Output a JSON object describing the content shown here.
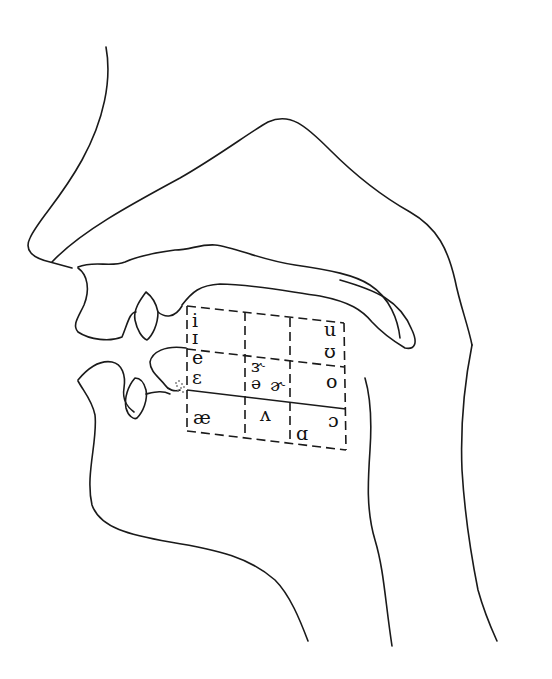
{
  "diagram": {
    "type": "sagittal vocal tract with vowel quadrilateral",
    "colors": {
      "line": "#1a1a1a",
      "background": "#ffffff"
    },
    "vowel_chart": {
      "rows": [
        "high",
        "mid",
        "low"
      ],
      "columns": [
        "front",
        "central",
        "back"
      ],
      "vowels": {
        "front_high_1": "i",
        "front_high_2": "ɪ",
        "front_mid_1": "e",
        "front_mid_2": "ɛ",
        "front_low": "æ",
        "central_mid_1": "ɝ",
        "central_mid_2": "ə",
        "central_mid_3": "ɚ",
        "central_low": "ʌ",
        "back_high_1": "u",
        "back_high_2": "ʊ",
        "back_mid": "o",
        "back_low_1": "ɔ",
        "back_low_2": "ɑ"
      }
    }
  }
}
